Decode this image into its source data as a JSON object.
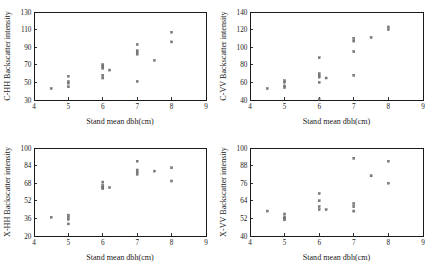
{
  "figure": {
    "title": "",
    "layout": "2x2 grid of scatter plots",
    "background_color": "#ffffff",
    "marker_color": "#7b7b7b",
    "axis_color": "#1a1a1a"
  },
  "chart_data": [
    {
      "type": "scatter",
      "panel": "top-left",
      "title": "",
      "xlabel": "Stand mean dbh(cm)",
      "ylabel": "C-HH Backscatter intensity",
      "xlim": [
        4,
        9
      ],
      "ylim": [
        30,
        130
      ],
      "xticks": [
        4,
        5,
        6,
        7,
        8,
        9
      ],
      "yticks": [
        30,
        50,
        70,
        90,
        110,
        130
      ],
      "grid": false,
      "legend": "none",
      "x": [
        4.5,
        5.0,
        5.0,
        5.0,
        5.0,
        6.0,
        6.0,
        6.0,
        6.0,
        6.0,
        6.2,
        7.0,
        7.0,
        7.0,
        7.0,
        7.0,
        7.5,
        8.0,
        8.0
      ],
      "y": [
        43,
        57,
        51,
        49,
        45,
        70,
        68,
        66,
        58,
        55,
        64,
        93,
        86,
        84,
        82,
        51,
        75,
        107,
        96
      ]
    },
    {
      "type": "scatter",
      "panel": "top-right",
      "title": "",
      "xlabel": "Stand mean dbh(cm)",
      "ylabel": "C-VV Backscatter intensity",
      "xlim": [
        4,
        9
      ],
      "ylim": [
        40,
        140
      ],
      "xticks": [
        4,
        5,
        6,
        7,
        8,
        9
      ],
      "yticks": [
        40,
        60,
        80,
        100,
        120,
        140
      ],
      "grid": false,
      "legend": "none",
      "x": [
        4.5,
        5.0,
        5.0,
        5.0,
        5.0,
        6.0,
        6.0,
        6.0,
        6.0,
        6.0,
        6.0,
        6.2,
        7.0,
        7.0,
        7.0,
        7.0,
        7.5,
        8.0,
        8.0
      ],
      "y": [
        53,
        62,
        60,
        56,
        54,
        88,
        70,
        68,
        66,
        60,
        41,
        65,
        110,
        107,
        95,
        68,
        111,
        123,
        120
      ]
    },
    {
      "type": "scatter",
      "panel": "bottom-left",
      "title": "",
      "xlabel": "Stand mean dbh(cm)",
      "ylabel": "X-HH Backscatter intensity",
      "xlim": [
        4,
        9
      ],
      "ylim": [
        20,
        100
      ],
      "xticks": [
        4,
        5,
        6,
        7,
        8,
        9
      ],
      "yticks": [
        20,
        36,
        52,
        68,
        84,
        100
      ],
      "grid": false,
      "legend": "none",
      "x": [
        4.5,
        5.0,
        5.0,
        5.0,
        5.0,
        6.0,
        6.0,
        6.0,
        6.0,
        6.2,
        7.0,
        7.0,
        7.0,
        7.0,
        7.5,
        8.0,
        8.0
      ],
      "y": [
        37,
        39,
        37,
        35,
        31,
        69,
        66,
        64,
        63,
        64,
        88,
        80,
        78,
        76,
        79,
        82,
        70
      ]
    },
    {
      "type": "scatter",
      "panel": "bottom-right",
      "title": "",
      "xlabel": "Stand mean dbh(cm)",
      "ylabel": "X-VV Backscatter intensity",
      "xlim": [
        4,
        9
      ],
      "ylim": [
        40,
        100
      ],
      "xticks": [
        4,
        5,
        6,
        7,
        8,
        9
      ],
      "yticks": [
        40,
        52,
        64,
        76,
        88,
        100
      ],
      "grid": false,
      "legend": "none",
      "x": [
        4.5,
        5.0,
        5.0,
        5.0,
        5.0,
        6.0,
        6.0,
        6.0,
        6.0,
        6.2,
        7.0,
        7.0,
        7.0,
        7.0,
        7.5,
        8.0,
        8.0
      ],
      "y": [
        57,
        55,
        53,
        52,
        51,
        69,
        64,
        60,
        58,
        58,
        93,
        62,
        60,
        57,
        81,
        91,
        76
      ]
    }
  ]
}
